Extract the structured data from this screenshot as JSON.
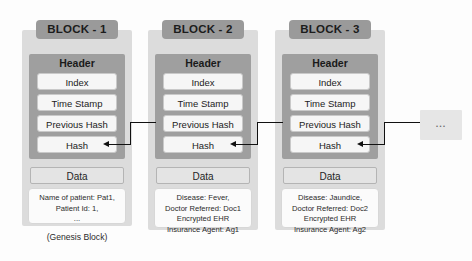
{
  "diagram": {
    "header_label": "Header",
    "data_label": "Data",
    "header_fields": [
      "Index",
      "Time Stamp",
      "Previous Hash",
      "Hash"
    ],
    "genesis_caption": "(Genesis Block)",
    "continuation_label": "...",
    "colors": {
      "block_band": "#dcdcdc",
      "title_pill": "#9a9a9a",
      "header_panel": "#9f9f9f",
      "field_row": "#f6f6f6",
      "data_label_box": "#e4e4e4",
      "data_body_box": "#fbfbfb",
      "connector": "#111111",
      "continuation_box": "#e6e6e6"
    },
    "blocks": [
      {
        "title": "BLOCK - 1",
        "fields": [
          "Index",
          "Time Stamp",
          "Previous Hash",
          "Hash"
        ],
        "data_label": "Data",
        "data_lines": [
          "Name of patient: Pat1,",
          "Patient Id: 1,",
          "..."
        ],
        "caption": "(Genesis Block)"
      },
      {
        "title": "BLOCK - 2",
        "fields": [
          "Index",
          "Time Stamp",
          "Previous Hash",
          "Hash"
        ],
        "data_label": "Data",
        "data_lines": [
          "Disease: Fever,",
          "Doctor Referred: Doc1",
          "Encrypted EHR",
          "Insurance Agent: Ag1"
        ],
        "caption": ""
      },
      {
        "title": "BLOCK - 3",
        "fields": [
          "Index",
          "Time Stamp",
          "Previous Hash",
          "Hash"
        ],
        "data_label": "Data",
        "data_lines": [
          "Disease: Jaundice,",
          "Doctor Referred: Doc2",
          "Encrypted EHR",
          "Insurance Agent: Ag2"
        ],
        "caption": ""
      }
    ]
  }
}
